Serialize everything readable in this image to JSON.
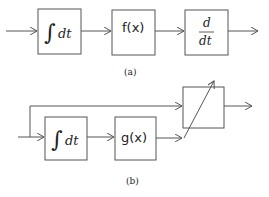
{
  "diagram_a": {
    "caption": "(a)",
    "blocks": [
      {
        "id": "integrator",
        "integral_sign": "∫",
        "label": "dt"
      },
      {
        "id": "function",
        "label": "f(x)"
      },
      {
        "id": "differentiator",
        "numerator": "d",
        "denominator": "dt"
      }
    ]
  },
  "diagram_b": {
    "caption": "(b)",
    "blocks": [
      {
        "id": "integrator",
        "integral_sign": "∫",
        "label": "dt"
      },
      {
        "id": "function",
        "label": "g(x)"
      },
      {
        "id": "variable-block",
        "label": ""
      }
    ]
  },
  "colors": {
    "stroke": "#555555",
    "text": "#222222",
    "background": "#ffffff"
  }
}
